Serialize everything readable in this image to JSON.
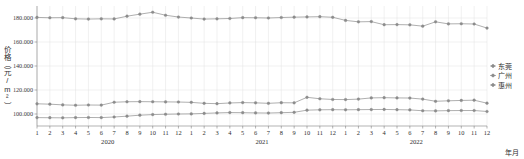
{
  "chart_data": {
    "type": "line",
    "title": "",
    "xlabel": "年月",
    "ylabel": "价格（元/m²）",
    "ylim": [
      90000,
      190000
    ],
    "yticks": [
      100000,
      120000,
      140000,
      160000,
      180000
    ],
    "ytick_labels": [
      "100.000",
      "120.000",
      "140.000",
      "160.000",
      "180.000"
    ],
    "grid": true,
    "legend_position": "right",
    "categories": [
      "1",
      "2",
      "3",
      "4",
      "5",
      "6",
      "7",
      "8",
      "9",
      "10",
      "11",
      "12",
      "1",
      "2",
      "3",
      "4",
      "5",
      "6",
      "7",
      "8",
      "9",
      "10",
      "11",
      "12",
      "1",
      "2",
      "3",
      "4",
      "5",
      "6",
      "7",
      "8",
      "9",
      "10",
      "11",
      "12"
    ],
    "year_groups": [
      {
        "label": "2020",
        "start_index": 0,
        "end_index": 11
      },
      {
        "label": "2021",
        "start_index": 12,
        "end_index": 23
      },
      {
        "label": "2022",
        "start_index": 24,
        "end_index": 35
      }
    ],
    "series": [
      {
        "name": "东莞",
        "color": "#8c8c8c",
        "values": [
          180500,
          180200,
          180300,
          179300,
          179100,
          179300,
          179200,
          181500,
          183200,
          184800,
          182300,
          180800,
          180000,
          179100,
          179300,
          179600,
          180300,
          180200,
          180000,
          180400,
          180700,
          180900,
          181100,
          180600,
          178000,
          176800,
          177000,
          174400,
          174500,
          174300,
          173200,
          176800,
          175100,
          175200,
          175000,
          171600
        ]
      },
      {
        "name": "广州",
        "color": "#8c8c8c",
        "values": [
          108500,
          108200,
          107600,
          107300,
          107500,
          107400,
          109800,
          110200,
          110300,
          110200,
          110100,
          110000,
          109700,
          108900,
          108600,
          109200,
          109500,
          109300,
          108900,
          109400,
          109300,
          113900,
          112700,
          112100,
          112000,
          112400,
          113400,
          113600,
          113400,
          113300,
          112400,
          110600,
          111000,
          111300,
          111500,
          109000
        ]
      },
      {
        "name": "惠州",
        "color": "#8c8c8c",
        "values": [
          97000,
          96900,
          96800,
          97000,
          97100,
          97000,
          97500,
          98200,
          99000,
          99500,
          99800,
          100000,
          100100,
          100500,
          100900,
          101200,
          101100,
          100900,
          100800,
          101100,
          101400,
          103200,
          103500,
          103600,
          103500,
          103600,
          103700,
          103800,
          103600,
          103400,
          102700,
          102600,
          102800,
          102900,
          102900,
          102100
        ]
      }
    ]
  },
  "legend": {
    "items": [
      {
        "label": "东莞"
      },
      {
        "label": "广州"
      },
      {
        "label": "惠州"
      }
    ]
  }
}
